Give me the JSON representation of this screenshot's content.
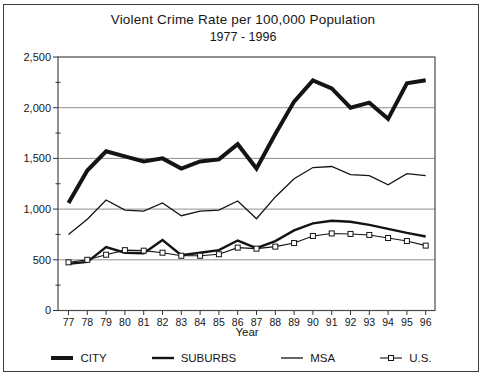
{
  "chart_data": {
    "type": "line",
    "title": "Violent Crime Rate per 100,000 Population",
    "subtitle": "1977 - 1996",
    "xlabel": "Year",
    "ylabel": "",
    "ylim": [
      0,
      2500
    ],
    "ytick_major_step": 500,
    "ytick_minor_step": 250,
    "ytick_labels": [
      "0",
      "500",
      "1,000",
      "1,500",
      "2,000",
      "2,500"
    ],
    "grid": "horizontal-major",
    "legend_position": "bottom",
    "categories": [
      "77",
      "78",
      "79",
      "80",
      "81",
      "82",
      "83",
      "84",
      "85",
      "86",
      "87",
      "88",
      "89",
      "90",
      "91",
      "92",
      "93",
      "94",
      "95",
      "96"
    ],
    "series": [
      {
        "name": "CITY",
        "style": "thick",
        "values": [
          1060,
          1380,
          1570,
          1520,
          1470,
          1500,
          1400,
          1470,
          1490,
          1640,
          1400,
          1740,
          2060,
          2270,
          2190,
          2000,
          2050,
          1890,
          2240,
          2270
        ]
      },
      {
        "name": "SUBURBS",
        "style": "medium",
        "values": [
          460,
          480,
          625,
          570,
          565,
          695,
          545,
          570,
          595,
          690,
          615,
          685,
          790,
          860,
          885,
          875,
          845,
          805,
          765,
          730
        ]
      },
      {
        "name": "MSA",
        "style": "thin",
        "values": [
          750,
          900,
          1090,
          990,
          980,
          1060,
          935,
          980,
          990,
          1080,
          905,
          1120,
          1300,
          1410,
          1420,
          1340,
          1330,
          1240,
          1350,
          1330
        ]
      },
      {
        "name": "U.S.",
        "style": "thin-square-markers",
        "values": [
          475,
          500,
          550,
          595,
          590,
          570,
          540,
          540,
          555,
          620,
          610,
          630,
          665,
          735,
          760,
          755,
          745,
          715,
          685,
          640
        ]
      }
    ],
    "colors": {
      "line": "#141414",
      "grid": "#8f8f8f",
      "plot_border": "#4a4a4a",
      "frame": "#3c3c3c",
      "background": "#ffffff",
      "marker_fill": "#ffffff"
    }
  }
}
